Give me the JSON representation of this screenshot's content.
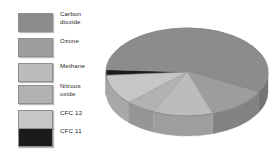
{
  "figure": {
    "type": "3d-pie-chart",
    "title": "",
    "background": "#ffffff"
  },
  "legend": {
    "position": "left",
    "items": [
      {
        "label": "Carbon\ndioxide",
        "color": "#8c8c8c",
        "lines": 2
      },
      {
        "label": "Ozone",
        "color": "#9d9d9d",
        "lines": 1
      },
      {
        "label": "Methane",
        "color": "#bcbcbc",
        "lines": 1
      },
      {
        "label": "Nitrous\noxide",
        "color": "#b2b2b2",
        "lines": 2
      },
      {
        "label": "CFC 12",
        "color": "#c6c6c6",
        "lines": 1
      },
      {
        "label": "CFC 11",
        "color": "#1b1b1b",
        "lines": 1
      }
    ]
  },
  "chart_data": {
    "type": "pie",
    "title": "",
    "xlabel": "",
    "ylabel": "",
    "legend_position": "left",
    "grid": false,
    "three_d": true,
    "categories": [
      "Carbon dioxide",
      "Ozone",
      "Methane",
      "Nitrous oxide",
      "CFC 12",
      "CFC 11"
    ],
    "values": [
      57,
      12,
      12,
      6,
      11,
      2
    ],
    "colors": [
      "#8c8c8c",
      "#9d9d9d",
      "#bcbcbc",
      "#b2b2b2",
      "#c6c6c6",
      "#1b1b1b"
    ],
    "side_colors": [
      "#747474",
      "#828282",
      "#9e9e9e",
      "#969696",
      "#a8a8a8",
      "#141414"
    ],
    "units": "percent"
  },
  "geometry": {
    "center_x": 83,
    "center_y": 64,
    "radius_x": 81,
    "radius_y": 44,
    "depth": 20,
    "start_angle_deg": 183
  }
}
